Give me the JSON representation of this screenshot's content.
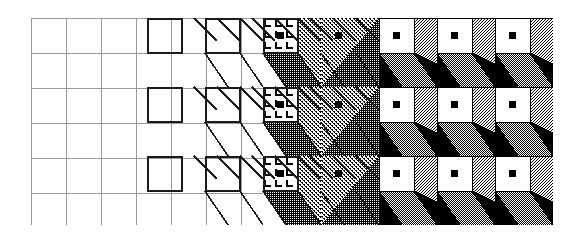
{
  "figure": {
    "background_color": "#ffffff",
    "ink_color": "#000000"
  },
  "geometry": {
    "origin_x": 31,
    "origin_y": 18,
    "cell": 35,
    "columns": 15,
    "rows": 6,
    "width": 522,
    "height": 207,
    "block_columns": 9,
    "block_rows": 3,
    "block_width": 58,
    "block_height": 69,
    "cube_depth": 23
  },
  "palette": {
    "black": "#000000",
    "white": "#ffffff",
    "grid_light": "#999999",
    "grid_bold": "#1a1a1a",
    "dither_dark": "#000000",
    "dither_mid": "#4d4d4d",
    "dither_light": "#d8d8d8"
  },
  "stages": [
    {
      "index": 1,
      "name": "faint-grid",
      "label": "Faint grid only",
      "features": [
        "light-grid"
      ]
    },
    {
      "index": 2,
      "name": "faint-grid-2",
      "label": "Faint grid only",
      "features": [
        "light-grid"
      ]
    },
    {
      "index": 3,
      "name": "wireframe-square",
      "label": "Bold front face outline",
      "features": [
        "light-grid",
        "bold-square"
      ]
    },
    {
      "index": 4,
      "name": "wireframe-diagonals",
      "label": "Outline plus depth diagonals",
      "features": [
        "light-grid",
        "bold-square",
        "diagonals"
      ]
    },
    {
      "index": 5,
      "name": "hatched-face",
      "label": "Hatched face texture",
      "features": [
        "bold-square",
        "diagonals",
        "hatch-texture",
        "center-dot"
      ]
    },
    {
      "index": 6,
      "name": "dense-dither",
      "label": "Dense dithered shading",
      "features": [
        "diagonals",
        "dense-dither",
        "center-dot"
      ]
    },
    {
      "index": 7,
      "name": "solid-cube-a",
      "label": "Solid shaded cube",
      "features": [
        "black-ground",
        "white-face",
        "center-dot",
        "light-top",
        "mid-side"
      ]
    },
    {
      "index": 8,
      "name": "solid-cube-b",
      "label": "Solid shaded cube",
      "features": [
        "black-ground",
        "white-face",
        "center-dot",
        "light-top",
        "mid-side"
      ]
    },
    {
      "index": 9,
      "name": "solid-cube-c",
      "label": "Solid shaded cube",
      "features": [
        "black-ground",
        "white-face",
        "center-dot",
        "light-top",
        "mid-side"
      ]
    }
  ],
  "rows": [
    {
      "index": 1,
      "name": "row-top"
    },
    {
      "index": 2,
      "name": "row-middle"
    },
    {
      "index": 3,
      "name": "row-bottom"
    }
  ],
  "chart_data": {
    "type": "heatmap",
    "xlabel": "Rendering stage (left to right)",
    "ylabel": "Repeat row",
    "categories": [
      "faint-grid",
      "faint-grid-2",
      "wireframe-square",
      "wireframe-diagonals",
      "hatched-face",
      "dense-dither",
      "solid-cube-a",
      "solid-cube-b",
      "solid-cube-c"
    ],
    "series": [
      {
        "name": "row-top",
        "values": [
          0,
          0,
          1,
          2,
          3,
          4,
          5,
          5,
          5
        ]
      },
      {
        "name": "row-middle",
        "values": [
          0,
          0,
          1,
          2,
          3,
          4,
          5,
          5,
          5
        ]
      },
      {
        "name": "row-bottom",
        "values": [
          0,
          0,
          1,
          2,
          3,
          4,
          5,
          5,
          5
        ]
      }
    ],
    "value_legend": {
      "0": "faint grid",
      "1": "bold square outline",
      "2": "outline with diagonals",
      "3": "hatched texture face",
      "4": "dense dither",
      "5": "solid shaded cube"
    },
    "grid": true,
    "legend": "none",
    "xlim": [
      1,
      9
    ],
    "ylim": [
      1,
      3
    ]
  }
}
